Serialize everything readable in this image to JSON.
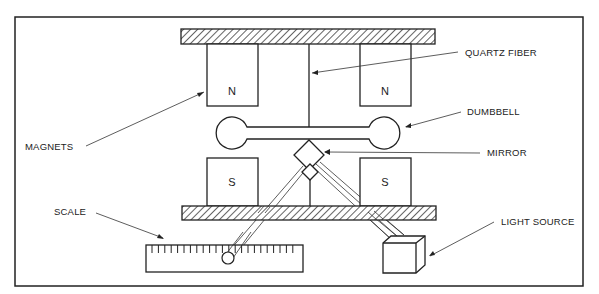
{
  "diagram": {
    "labels": {
      "quartz_fiber": "QUARTZ FIBER",
      "dumbbell": "DUMBBELL",
      "magnets": "MAGNETS",
      "mirror": "MIRROR",
      "scale": "SCALE",
      "light_source": "LIGHT SOURCE"
    },
    "poles": {
      "top_left": "N",
      "top_right": "N",
      "bottom_left": "S",
      "bottom_right": "S"
    },
    "colors": {
      "ink": "#222222",
      "background": "#ffffff"
    }
  }
}
